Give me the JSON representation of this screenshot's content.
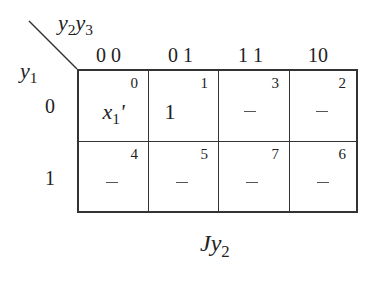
{
  "title": "Jy2",
  "row_variable": "y1",
  "column_variables": "y2y3",
  "column_labels": [
    "0 0",
    "0 1",
    "1 1",
    "10"
  ],
  "row_labels": [
    "0",
    "1"
  ],
  "cells": [
    [
      {
        "index": "0",
        "value": "x1'"
      },
      {
        "index": "1",
        "value": "1"
      },
      {
        "index": "3",
        "value": "–"
      },
      {
        "index": "2",
        "value": "–"
      }
    ],
    [
      {
        "index": "4",
        "value": "–"
      },
      {
        "index": "5",
        "value": "–"
      },
      {
        "index": "7",
        "value": "–"
      },
      {
        "index": "6",
        "value": "–"
      }
    ]
  ]
}
